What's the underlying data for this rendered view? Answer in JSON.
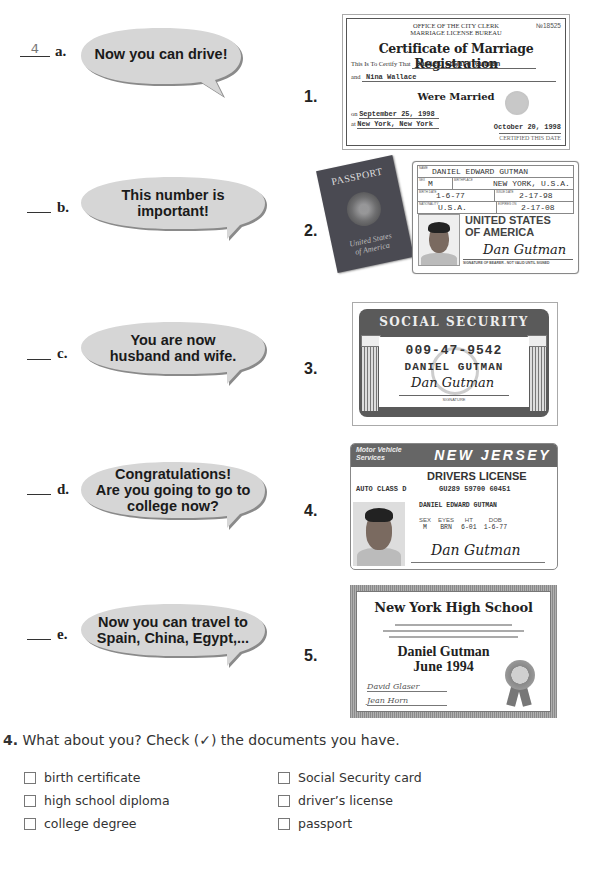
{
  "matching": {
    "rows": [
      {
        "answer": "4",
        "letter": "a.",
        "bubble": "Now you can drive!"
      },
      {
        "answer": "",
        "letter": "b.",
        "bubble": "This number is important!"
      },
      {
        "answer": "",
        "letter": "c.",
        "bubble": "You are now husband and wife."
      },
      {
        "answer": "",
        "letter": "d.",
        "bubble": "Congratulations! Are you going to go to college now?"
      },
      {
        "answer": "",
        "letter": "e.",
        "bubble": "Now you can travel to Spain, China, Egypt,..."
      }
    ],
    "bubble_lines": {
      "a": [
        "Now you can drive!"
      ],
      "b": [
        "This number is",
        "important!"
      ],
      "c": [
        "You are now",
        "husband and wife."
      ],
      "d": [
        "Congratulations!",
        "Are you going to go to",
        "college now?"
      ],
      "e": [
        "Now you can travel to",
        "Spain, China, Egypt,..."
      ]
    },
    "doc_numbers": [
      "1.",
      "2.",
      "3.",
      "4.",
      "5."
    ]
  },
  "documents": {
    "marriage_certificate": {
      "office_line1": "OFFICE OF THE CITY CLERK",
      "office_line2": "MARRIAGE LICENSE BUREAU",
      "number": "№18525",
      "title": "Certificate of Marriage Registration",
      "certify_label": "This Is To Certify That",
      "person1": "Daniel Edward Gutman",
      "and_label": "and",
      "person2": "Nina Wallace",
      "were_married": "Were Married",
      "on_label": "on",
      "date": "September 25, 1998",
      "at_label": "at",
      "place": "New York, New York",
      "certified_date": "October 20, 1998",
      "certified_label": "CERTIFIED THIS DATE"
    },
    "passport": {
      "cover_title": "PASSPORT",
      "cover_country_line1": "United States",
      "cover_country_line2": "of America",
      "id_page": {
        "name_label": "NAME",
        "name": "DANIEL EDWARD GUTMAN",
        "sex_label": "SEX",
        "sex": "M",
        "birthplace_label": "BIRTHPLACE",
        "birthplace": "NEW YORK, U.S.A.",
        "birth_date_label": "BIRTH DATE",
        "birth_date": "1-6-77",
        "issue_date_label": "ISSUE DATE",
        "issue_date": "2-17-98",
        "nationality_label": "NATIONALITY",
        "nationality": "U.S.A.",
        "expires_label": "EXPIRES ON",
        "expires": "2-17-08",
        "country_line1": "UNITED STATES",
        "country_line2": "OF AMERICA",
        "signature": "Dan Gutman",
        "signature_note": "SIGNATURE OF BEARER - NOT VALID UNTIL SIGNED"
      }
    },
    "social_security": {
      "title": "SOCIAL SECURITY",
      "number": "009-47-9542",
      "name": "DANIEL GUTMAN",
      "signature": "Dan Gutman",
      "signature_label": "SIGNATURE"
    },
    "drivers_license": {
      "agency_line1": "Motor Vehicle",
      "agency_line2": "Services",
      "state": "NEW JERSEY",
      "type": "DRIVERS LICENSE",
      "class": "AUTO CLASS D",
      "license_number": "GU289 59700 60451",
      "name": "DANIEL EDWARD GUTMAN",
      "fields": [
        {
          "label": "SEX",
          "value": "M"
        },
        {
          "label": "EYES",
          "value": "BRN"
        },
        {
          "label": "HT",
          "value": "6-01"
        },
        {
          "label": "DOB",
          "value": "1-6-77"
        }
      ],
      "signature": "Dan Gutman"
    },
    "diploma": {
      "school": "New York High School",
      "name": "Daniel Gutman",
      "date": "June 1994",
      "signer1": "David Glaser",
      "signer2": "Jean Horn"
    }
  },
  "exercise4": {
    "number": "4.",
    "prompt": "What about you? Check (✓) the documents you have.",
    "items_left": [
      "birth certificate",
      "high school diploma",
      "college degree"
    ],
    "items_right": [
      "Social Security card",
      "driver’s license",
      "passport"
    ]
  },
  "colors": {
    "bubble_fill": "#d6d6d6",
    "bubble_shadow": "#8a8a8a",
    "text": "#222222"
  }
}
